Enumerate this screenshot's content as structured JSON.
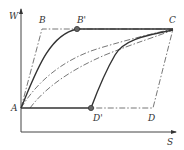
{
  "diagram": {
    "axes": {
      "y_label": "W",
      "x_label": "S"
    },
    "points": {
      "A": "A",
      "B": "B",
      "B_prime": "B'",
      "C": "C",
      "D": "D",
      "D_prime": "D'"
    },
    "colors": {
      "line": "#333333",
      "dashdot": "#666666",
      "marker": "#666666"
    }
  }
}
